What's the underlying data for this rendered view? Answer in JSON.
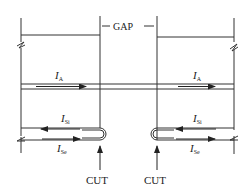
{
  "diagram": {
    "gap_label": "GAP",
    "cut_labels": [
      "CUT",
      "CUT"
    ],
    "currents": {
      "ia_left": {
        "main": "I",
        "sub": "A"
      },
      "ia_right": {
        "main": "I",
        "sub": "A"
      },
      "isi_left": {
        "main": "I",
        "sub": "Si"
      },
      "ise_left": {
        "main": "I",
        "sub": "Se"
      },
      "isi_right": {
        "main": "I",
        "sub": "Si"
      },
      "ise_right": {
        "main": "I",
        "sub": "Se"
      }
    },
    "colors": {
      "line": "#333333",
      "background": "#ffffff"
    }
  }
}
